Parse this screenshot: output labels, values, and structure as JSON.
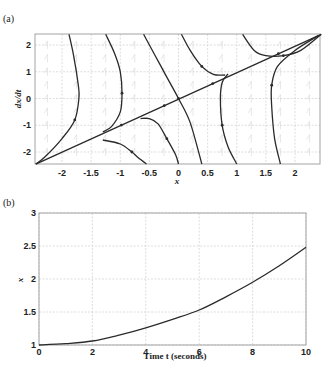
{
  "figure": {
    "panel_a_label": "(a)",
    "panel_b_label": "(b)"
  },
  "chart_data": [
    {
      "type": "line",
      "title": "Phase portrait",
      "panel": "(a)",
      "xlabel": "x",
      "ylabel": "dx/dt",
      "xlim": [
        -2.45,
        2.45
      ],
      "ylim": [
        -2.45,
        2.4
      ],
      "xticks": [
        "-2",
        "-1.5",
        "-1",
        "-0.5",
        "0",
        "0.5",
        "1",
        "1.5",
        "2"
      ],
      "yticks": [
        "2",
        "1",
        "0",
        "-1",
        "-2"
      ],
      "grid": true,
      "series": [
        {
          "name": "invariant line dx/dt = x",
          "x": [
            -2.45,
            2.45
          ],
          "y": [
            -2.45,
            2.4
          ]
        },
        {
          "name": "trajectory 1",
          "x": [
            -1.88,
            -1.8,
            -1.72,
            -1.71,
            -1.78,
            -2.0,
            -2.3,
            -2.45
          ],
          "y": [
            2.4,
            1.6,
            0.5,
            0.0,
            -0.8,
            -1.5,
            -2.2,
            -2.45
          ]
        },
        {
          "name": "trajectory 2",
          "x": [
            -1.25,
            -1.1,
            -1.0,
            -0.97,
            -1.0,
            -1.15,
            -1.3
          ],
          "y": [
            2.4,
            1.7,
            1.0,
            0.2,
            -0.5,
            -1.05,
            -1.25
          ]
        },
        {
          "name": "trajectory 3",
          "x": [
            -0.6,
            -0.4,
            -0.2,
            0.0,
            0.2,
            0.4
          ],
          "y": [
            2.4,
            1.6,
            0.8,
            0.0,
            -0.9,
            -2.45
          ]
        },
        {
          "name": "trajectory 4",
          "x": [
            -1.3,
            -1.0,
            -0.8,
            -0.7,
            -0.55
          ],
          "y": [
            -1.55,
            -1.7,
            -2.0,
            -2.2,
            -2.45
          ]
        },
        {
          "name": "trajectory 5",
          "x": [
            -0.65,
            -0.5,
            -0.35,
            -0.2,
            -0.05,
            0.0
          ],
          "y": [
            -0.75,
            -0.75,
            -0.95,
            -1.5,
            -2.1,
            -2.45
          ]
        },
        {
          "name": "trajectory 6",
          "x": [
            0.05,
            0.2,
            0.4,
            0.6,
            0.8
          ],
          "y": [
            2.4,
            1.8,
            1.2,
            0.9,
            0.88
          ]
        },
        {
          "name": "trajectory 7",
          "x": [
            0.85,
            0.75,
            0.72,
            0.75,
            0.85,
            1.0
          ],
          "y": [
            0.92,
            0.6,
            0.0,
            -1.0,
            -1.8,
            -2.45
          ]
        },
        {
          "name": "trajectory 8",
          "x": [
            1.1,
            1.3,
            1.5,
            1.8,
            2.1,
            2.45
          ],
          "y": [
            2.4,
            1.8,
            1.6,
            1.6,
            1.8,
            2.4
          ]
        },
        {
          "name": "trajectory 9",
          "x": [
            2.4,
            2.0,
            1.7,
            1.6,
            1.6,
            1.65,
            1.75
          ],
          "y": [
            2.35,
            1.8,
            1.2,
            0.5,
            -0.3,
            -1.5,
            -2.45
          ]
        }
      ]
    },
    {
      "type": "line",
      "title": "Time response",
      "panel": "(b)",
      "xlabel": "Time t (seconds)",
      "ylabel": "x",
      "xlim": [
        0,
        10
      ],
      "ylim": [
        1,
        3
      ],
      "xticks": [
        "0",
        "2",
        "4",
        "6",
        "8",
        "10"
      ],
      "yticks": [
        "3",
        "2.5",
        "2",
        "1.5",
        "1"
      ],
      "grid": true,
      "series": [
        {
          "name": "x(t)",
          "x": [
            0,
            1,
            2,
            3,
            4,
            5,
            6,
            7,
            8,
            9,
            10
          ],
          "y": [
            1.0,
            1.02,
            1.06,
            1.15,
            1.26,
            1.39,
            1.53,
            1.73,
            1.95,
            2.2,
            2.48
          ]
        }
      ]
    }
  ]
}
